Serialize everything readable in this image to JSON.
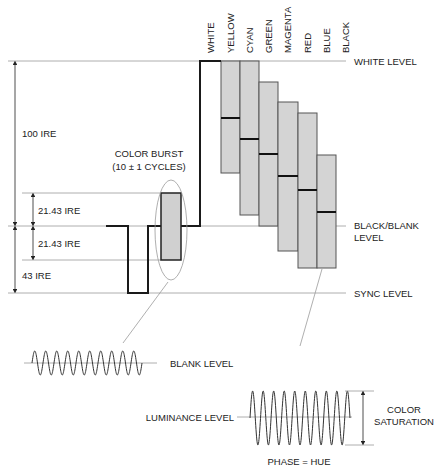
{
  "color_bars": {
    "labels": [
      "WHITE",
      "YELLOW",
      "CYAN",
      "GREEN",
      "MAGENTA",
      "RED",
      "BLUE",
      "BLACK"
    ]
  },
  "levels": {
    "white": "WHITE  LEVEL",
    "black_blank_line1": "BLACK/BLANK",
    "black_blank_line2": "LEVEL",
    "sync": "SYNC LEVEL"
  },
  "measurements": {
    "ire_100": "100 IRE",
    "ire_2143_upper": "21.43 IRE",
    "ire_2143_lower": "21.43 IRE",
    "ire_43": "43 IRE"
  },
  "color_burst": {
    "line1": "COLOR BURST",
    "line2": "(10 ± 1 CYCLES)"
  },
  "burst_detail": {
    "label": "BLANK LEVEL"
  },
  "chroma_detail": {
    "luminance_label": "LUMINANCE LEVEL",
    "saturation_line1": "COLOR",
    "saturation_line2": "SATURATION",
    "phase_label": "PHASE = HUE"
  }
}
